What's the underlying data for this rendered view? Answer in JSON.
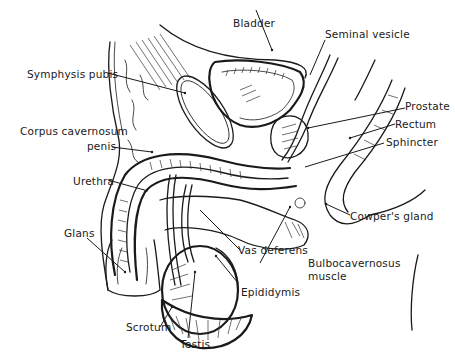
{
  "figure": {
    "type": "anatomical-illustration",
    "labels": [
      {
        "id": "bladder",
        "text": "Bladder"
      },
      {
        "id": "seminal-vesicle",
        "text": "Seminal vesicle"
      },
      {
        "id": "symphysis-pubis",
        "text": "Symphysis pubis"
      },
      {
        "id": "prostate",
        "text": "Prostate"
      },
      {
        "id": "rectum",
        "text": "Rectum"
      },
      {
        "id": "corpus-cavernosum-line1",
        "text": "Corpus cavernosum"
      },
      {
        "id": "corpus-cavernosum-line2",
        "text": "penis"
      },
      {
        "id": "sphincter",
        "text": "Sphincter"
      },
      {
        "id": "urethra",
        "text": "Urethra"
      },
      {
        "id": "cowpers-gland",
        "text": "Cowper's gland"
      },
      {
        "id": "glans",
        "text": "Glans"
      },
      {
        "id": "vas-deferens",
        "text": "Vas deferens"
      },
      {
        "id": "bulbocavernosus-line1",
        "text": "Bulbocavernosus"
      },
      {
        "id": "bulbocavernosus-line2",
        "text": "muscle"
      },
      {
        "id": "epididymis",
        "text": "Epididymis"
      },
      {
        "id": "scrotum",
        "text": "Scrotum"
      },
      {
        "id": "testis",
        "text": "Testis"
      }
    ]
  }
}
